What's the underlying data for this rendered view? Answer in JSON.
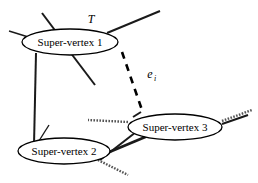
{
  "figure": {
    "type": "graph-diagram",
    "background_color": "#ffffff",
    "stroke_color": "#000000",
    "width": 258,
    "height": 183
  },
  "nodes": [
    {
      "id": "sv1",
      "label": "Super-vertex 1",
      "cx": 70,
      "cy": 42,
      "rx": 48,
      "ry": 13
    },
    {
      "id": "sv2",
      "label": "Super-vertex 2",
      "cx": 64,
      "cy": 151,
      "rx": 46,
      "ry": 13
    },
    {
      "id": "sv3",
      "label": "Super-vertex 3",
      "cx": 175,
      "cy": 127,
      "rx": 47,
      "ry": 13
    }
  ],
  "annotations": [
    {
      "id": "tree-label",
      "text": "T",
      "x": 91,
      "y": 23,
      "style": "italic"
    },
    {
      "id": "edge-label",
      "text": "e",
      "subscript": "i",
      "x": 150,
      "y": 78,
      "style": "italic"
    }
  ],
  "edges": {
    "tree_solid": [
      {
        "id": "sv1-up-left-stub",
        "x1": 9,
        "y1": 31,
        "x2": 38,
        "y2": 40,
        "weight": "thin"
      },
      {
        "id": "sv1-up-stub",
        "x1": 42,
        "y1": 13,
        "x2": 57,
        "y2": 33,
        "weight": "med"
      },
      {
        "id": "sv1-up-right-stub",
        "x1": 160,
        "y1": 11,
        "x2": 107,
        "y2": 33,
        "weight": "med"
      },
      {
        "id": "sv1-down-right-stub",
        "x1": 70,
        "y1": 52,
        "x2": 95,
        "y2": 85,
        "weight": "med"
      },
      {
        "id": "sv1-to-sv2-trunk",
        "x1": 36,
        "y1": 53,
        "x2": 34,
        "y2": 145,
        "weight": "med"
      },
      {
        "id": "sv2-up-stub",
        "x1": 49,
        "y1": 125,
        "x2": 37,
        "y2": 144,
        "weight": "thin"
      },
      {
        "id": "sv2-to-sv3-trunk",
        "x1": 107,
        "y1": 153,
        "x2": 150,
        "y2": 135,
        "weight": "thick"
      },
      {
        "id": "sv3-down-left-stub",
        "x1": 136,
        "y1": 132,
        "x2": 100,
        "y2": 160,
        "weight": "med"
      },
      {
        "id": "sv3-up-stub",
        "x1": 141,
        "y1": 112,
        "x2": 133,
        "y2": 117,
        "weight": "med"
      },
      {
        "id": "sv3-right-stub",
        "x1": 222,
        "y1": 124,
        "x2": 248,
        "y2": 115,
        "weight": "med"
      }
    ],
    "non_tree_dotted": [
      {
        "id": "sv3-left-dotted",
        "x1": 128,
        "y1": 122,
        "x2": 88,
        "y2": 120
      },
      {
        "id": "sv2-down-right-dotted",
        "x1": 98,
        "y1": 160,
        "x2": 128,
        "y2": 175
      },
      {
        "id": "sv3-upper-right-dotted",
        "x1": 222,
        "y1": 121,
        "x2": 252,
        "y2": 110
      }
    ],
    "selected_dashed": [
      {
        "id": "e-i",
        "x1": 122,
        "y1": 52,
        "x2": 143,
        "y2": 113
      }
    ]
  }
}
